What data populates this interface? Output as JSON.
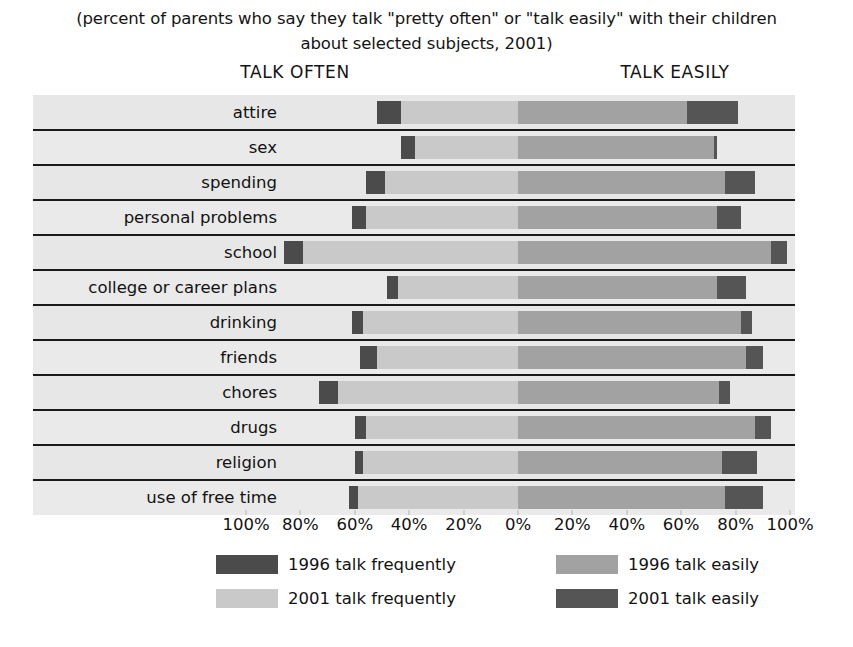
{
  "title": {
    "line1": "(percent of parents who say they talk \"pretty often\" or \"talk easily\" with their children",
    "line2": "about selected subjects, 2001)"
  },
  "headers": {
    "left": "TALK OFTEN",
    "right": "TALK EASILY"
  },
  "axis": {
    "ticks": [
      "100%",
      "80%",
      "60%",
      "40%",
      "20%",
      "0%",
      "20%",
      "40%",
      "60%",
      "80%",
      "100%"
    ]
  },
  "legend": {
    "items": [
      {
        "label": "1996 talk frequently",
        "color": "#4b4b4b"
      },
      {
        "label": "2001 talk frequently",
        "color": "#c9c9c9"
      },
      {
        "label": "1996 talk easily",
        "color": "#a2a2a2"
      },
      {
        "label": "2001 talk easily",
        "color": "#555555"
      }
    ]
  },
  "chart_data": {
    "type": "bar",
    "orientation": "horizontal",
    "layout": "diverging-paired",
    "title": "(percent of parents who say they talk \"pretty often\" or \"talk easily\" with their children about selected subjects, 2001)",
    "xlabel": "",
    "ylabel": "",
    "xlim": [
      -100,
      100
    ],
    "left_axis_label": "TALK OFTEN",
    "right_axis_label": "TALK EASILY",
    "grid": true,
    "legend_position": "bottom",
    "categories": [
      "attire",
      "sex",
      "spending",
      "personal problems",
      "school",
      "college or career plans",
      "drinking",
      "friends",
      "chores",
      "drugs",
      "religion",
      "use of free time"
    ],
    "series": [
      {
        "name": "1996 talk frequently",
        "color": "#4b4b4b",
        "side": "left",
        "values": [
          52,
          43,
          56,
          61,
          86,
          48,
          61,
          58,
          73,
          60,
          60,
          62
        ]
      },
      {
        "name": "2001 talk frequently",
        "color": "#c9c9c9",
        "side": "left",
        "values": [
          43,
          38,
          49,
          56,
          79,
          44,
          57,
          52,
          66,
          56,
          57,
          59
        ]
      },
      {
        "name": "1996 talk easily",
        "color": "#a2a2a2",
        "side": "right",
        "values": [
          62,
          72,
          76,
          73,
          93,
          73,
          82,
          84,
          74,
          87,
          75,
          76
        ]
      },
      {
        "name": "2001 talk easily",
        "color": "#555555",
        "side": "right",
        "values": [
          81,
          73,
          87,
          82,
          99,
          84,
          86,
          90,
          78,
          93,
          88,
          90
        ]
      }
    ]
  }
}
